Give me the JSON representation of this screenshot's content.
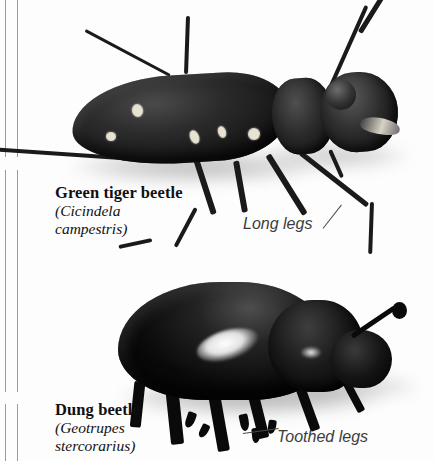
{
  "page": {
    "kind": "field-guide-plate",
    "background_color": "#fdfdfd",
    "margin_rule_color": "#9a9a9a"
  },
  "specimens": [
    {
      "id": "green-tiger-beetle",
      "common_name": "Green tiger beetle",
      "scientific_name_open": "(Cicindela",
      "scientific_name_close": "campestris)",
      "body_color": "#1a1a1a",
      "marking_color": "#e8e2d2",
      "annotation": "Long legs",
      "maculae": [
        {
          "left": 132,
          "top": 104,
          "w": 11,
          "h": 13,
          "rot": -12
        },
        {
          "left": 190,
          "top": 130,
          "w": 9,
          "h": 14,
          "rot": -22
        },
        {
          "left": 218,
          "top": 126,
          "w": 8,
          "h": 12,
          "rot": -18
        },
        {
          "left": 248,
          "top": 128,
          "w": 12,
          "h": 12,
          "rot": -8
        },
        {
          "left": 106,
          "top": 132,
          "w": 10,
          "h": 9,
          "rot": 6
        }
      ],
      "legs": [
        {
          "left": 196,
          "top": 156,
          "len": 58,
          "th": 6,
          "rot": 72
        },
        {
          "left": 236,
          "top": 158,
          "len": 52,
          "th": 6,
          "rot": 80
        },
        {
          "left": 268,
          "top": 152,
          "len": 70,
          "th": 6,
          "rot": 58
        },
        {
          "left": 196,
          "top": 206,
          "len": 44,
          "th": 4,
          "rot": 118
        },
        {
          "left": 152,
          "top": 238,
          "len": 34,
          "th": 4,
          "rot": 168
        },
        {
          "left": 300,
          "top": 150,
          "len": 86,
          "th": 5,
          "rot": 38
        },
        {
          "left": 372,
          "top": 200,
          "len": 52,
          "th": 4,
          "rot": 92
        },
        {
          "left": 330,
          "top": 148,
          "len": 30,
          "th": 4,
          "rot": 66
        }
      ],
      "antennae": [
        {
          "left": 148,
          "top": 158,
          "len": 160,
          "th": 4,
          "rot": 184
        },
        {
          "left": 330,
          "top": 86,
          "len": 90,
          "th": 4,
          "rot": -66
        },
        {
          "left": 360,
          "top": 30,
          "len": 46,
          "th": 5,
          "rot": -58
        },
        {
          "left": 186,
          "top": 72,
          "len": 58,
          "th": 4,
          "rot": -88
        },
        {
          "left": 170,
          "top": 74,
          "len": 96,
          "th": 3,
          "rot": 208
        }
      ]
    },
    {
      "id": "dung-beetle",
      "common_name": "Dung beetle",
      "scientific_name_open": "(Geotrupes",
      "scientific_name_close": "stercorarius)",
      "body_color": "#0a0a0a",
      "highlight_color": "#ffffff",
      "annotation": "Toothed legs",
      "legs": [
        {
          "left": 172,
          "top": 384,
          "len": 54,
          "th": 13,
          "rot": 84
        },
        {
          "left": 214,
          "top": 388,
          "len": 58,
          "th": 12,
          "rot": 80
        },
        {
          "left": 252,
          "top": 384,
          "len": 50,
          "th": 11,
          "rot": 76
        },
        {
          "left": 300,
          "top": 382,
          "len": 46,
          "th": 10,
          "rot": 70
        },
        {
          "left": 344,
          "top": 374,
          "len": 38,
          "th": 8,
          "rot": 62
        },
        {
          "left": 140,
          "top": 376,
          "len": 46,
          "th": 11,
          "rot": 96
        }
      ],
      "teeth": [
        {
          "left": 186,
          "top": 412,
          "w": 9,
          "h": 16,
          "rot": 18
        },
        {
          "left": 200,
          "top": 424,
          "w": 8,
          "h": 14,
          "rot": 26
        },
        {
          "left": 240,
          "top": 414,
          "w": 9,
          "h": 17,
          "rot": -12
        },
        {
          "left": 252,
          "top": 428,
          "w": 8,
          "h": 15,
          "rot": -6
        },
        {
          "left": 268,
          "top": 420,
          "w": 8,
          "h": 14,
          "rot": 8
        }
      ],
      "antenna": {
        "left": 352,
        "top": 334,
        "len": 52,
        "th": 5,
        "rot": -34
      },
      "antenna_club": {
        "left": 392,
        "top": 302,
        "w": 15,
        "h": 17
      }
    }
  ],
  "captions": [
    {
      "id": "tiger-caption",
      "left": 55,
      "top": 183
    },
    {
      "id": "dung-caption",
      "left": 55,
      "top": 400
    }
  ],
  "annotations": [
    {
      "id": "long-legs-label",
      "left": 243,
      "top": 215,
      "leader": {
        "left": 323,
        "top": 228,
        "len": 30,
        "rot": -52
      }
    },
    {
      "id": "toothed-legs-label",
      "left": 277,
      "top": 428,
      "leader": {
        "left": 243,
        "top": 433,
        "len": 36,
        "rot": -8
      }
    }
  ]
}
